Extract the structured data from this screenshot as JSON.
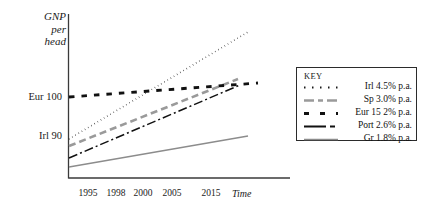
{
  "chart_data": {
    "type": "line",
    "title": "",
    "ylabel": "GNP per head",
    "xlabel": "Time",
    "grid": false,
    "legend_position": "right",
    "ylabel_lines": [
      "GNP",
      "per",
      "head"
    ],
    "y_ticks": [
      {
        "label": "Eur 100",
        "y_px": 97
      },
      {
        "label": "Irl 90",
        "y_px": 136
      }
    ],
    "x_ticks": [
      "1995",
      "1998",
      "2000",
      "2005",
      "2015"
    ],
    "x_tick_px": [
      88,
      116,
      143,
      172,
      211
    ],
    "axis_note": "Schematic projection: all series rise linearly from a common era near 1995 at the stated annual growth rates.",
    "series": [
      {
        "name": "Irl 4.5% p.a.",
        "short": "Irl",
        "growth_pct": 4.5,
        "style": "dotted",
        "color": "#1a1a1a",
        "width": 1.6,
        "dash": "0.5 3.2",
        "start": {
          "x": 69,
          "y": 139
        },
        "end": {
          "x": 248,
          "y": 32
        }
      },
      {
        "name": "Sp 3.0% p.a.",
        "short": "Sp",
        "growth_pct": 3.0,
        "style": "dashed",
        "color": "#9a9a9a",
        "width": 2.6,
        "dash": "7 4",
        "start": {
          "x": 69,
          "y": 146
        },
        "end": {
          "x": 238,
          "y": 79
        }
      },
      {
        "name": "Eur 15 2% p.a.",
        "short": "Eur 15",
        "growth_pct": 2.0,
        "style": "thick-dash",
        "color": "#111111",
        "width": 2.9,
        "dash": "5.5 7",
        "start": {
          "x": 69,
          "y": 97
        },
        "end": {
          "x": 258,
          "y": 83
        }
      },
      {
        "name": "Port 2.6% p.a.",
        "short": "Port",
        "growth_pct": 2.6,
        "style": "dash-dot",
        "color": "#111111",
        "width": 1.5,
        "dash": "9 3 2 3",
        "start": {
          "x": 69,
          "y": 158
        },
        "end": {
          "x": 240,
          "y": 85
        }
      },
      {
        "name": "Gr 1.8% p.a.",
        "short": "Gr",
        "growth_pct": 1.8,
        "style": "solid",
        "color": "#8c8c8c",
        "width": 1.3,
        "dash": "",
        "start": {
          "x": 69,
          "y": 167
        },
        "end": {
          "x": 248,
          "y": 136
        }
      }
    ]
  },
  "legend": {
    "title": "KEY",
    "entries": [
      {
        "label": "Irl 4.5% p.a."
      },
      {
        "label": "Sp 3.0% p.a."
      },
      {
        "label": "Eur 15 2% p.a."
      },
      {
        "label": "Port 2.6% p.a."
      },
      {
        "label": "Gr 1.8% p.a."
      }
    ]
  }
}
